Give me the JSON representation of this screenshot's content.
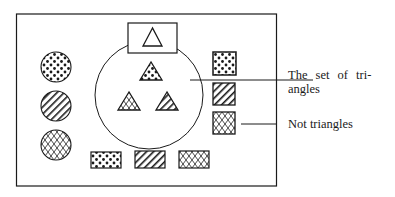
{
  "labels": {
    "set_of_triangles_line1": "The set of tri-",
    "set_of_triangles_line2": "angles",
    "not_triangles": "Not triangles"
  },
  "colors": {
    "ink": "#1a1a1a",
    "background": "#ffffff"
  },
  "diagram": {
    "universe_frame": {
      "x": 16,
      "y": 14,
      "width": 260,
      "height": 172
    },
    "set_circle": {
      "cx": 149,
      "cy": 95,
      "r": 54,
      "label": "The set of triangles"
    },
    "inside_set": [
      {
        "shape": "triangle",
        "pattern": "none",
        "note": "plain triangle in box at top"
      },
      {
        "shape": "triangle",
        "pattern": "dots"
      },
      {
        "shape": "triangle",
        "pattern": "crosshatch"
      },
      {
        "shape": "triangle",
        "pattern": "diagonal-stripes"
      }
    ],
    "outside_set": [
      {
        "shape": "circle",
        "pattern": "dots"
      },
      {
        "shape": "circle",
        "pattern": "diagonal-stripes"
      },
      {
        "shape": "circle",
        "pattern": "crosshatch"
      },
      {
        "shape": "square",
        "pattern": "dots"
      },
      {
        "shape": "square",
        "pattern": "diagonal-stripes"
      },
      {
        "shape": "square",
        "pattern": "crosshatch"
      },
      {
        "shape": "rectangle",
        "pattern": "dots"
      },
      {
        "shape": "rectangle",
        "pattern": "diagonal-stripes"
      },
      {
        "shape": "rectangle",
        "pattern": "crosshatch"
      }
    ],
    "outside_label": "Not triangles"
  }
}
